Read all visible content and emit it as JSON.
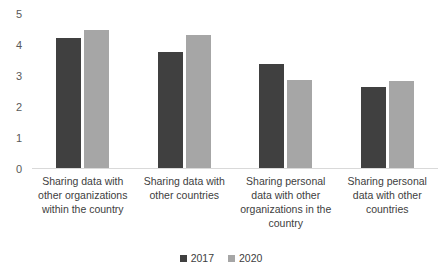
{
  "chart_data": {
    "type": "bar",
    "title": "",
    "subtitle": "",
    "xlabel": "",
    "ylabel": "",
    "ylim": [
      0,
      5
    ],
    "yticks": [
      0,
      1,
      2,
      3,
      4,
      5
    ],
    "ytick_labels": [
      "0",
      "1",
      "2",
      "3",
      "4",
      "5"
    ],
    "grid": false,
    "legend_position": "bottom",
    "categories": [
      "Sharing data with other organizations within the country",
      "Sharing data with other countries",
      "Sharing personal data with other organizations in the country",
      "Sharing personal data with other countries"
    ],
    "series": [
      {
        "name": "2017",
        "color": "#404040",
        "values": [
          4.2,
          3.75,
          3.35,
          2.6
        ]
      },
      {
        "name": "2020",
        "color": "#a6a6a6",
        "values": [
          4.45,
          4.3,
          2.85,
          2.8
        ]
      }
    ]
  },
  "legend": {
    "items": [
      {
        "label": "2017",
        "color": "#404040"
      },
      {
        "label": "2020",
        "color": "#a6a6a6"
      }
    ]
  },
  "axis": {
    "y_labels": [
      "5",
      "4",
      "3",
      "2",
      "1",
      "0"
    ]
  }
}
